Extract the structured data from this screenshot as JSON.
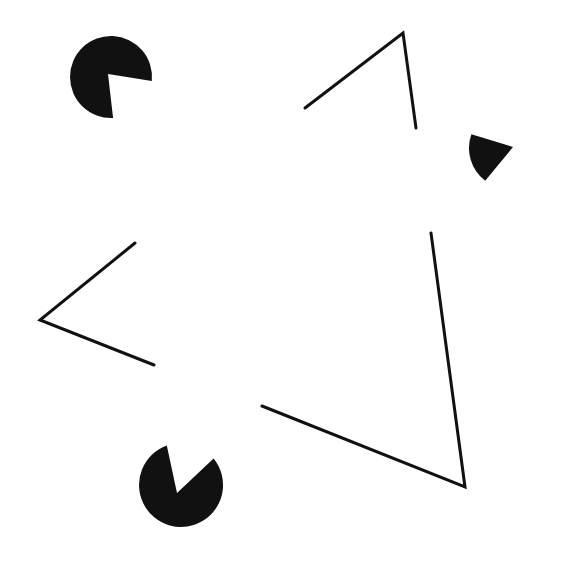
{
  "figure": {
    "width": 584,
    "height": 565,
    "background": "#ffffff",
    "ink_color": "#111111",
    "line_width": 3
  },
  "inducers": [
    {
      "name": "top-left",
      "cx": 111,
      "cy": 77,
      "r": 41,
      "mouth": [
        [
          151,
          81
        ],
        [
          108,
          74
        ],
        [
          113,
          116
        ]
      ]
    },
    {
      "name": "right",
      "cx": 510,
      "cy": 148,
      "r": 41,
      "mouth": [
        [
          468,
          133
        ],
        [
          513,
          147
        ],
        [
          485,
          181
        ]
      ]
    },
    {
      "name": "bottom",
      "cx": 181,
      "cy": 485,
      "r": 42,
      "mouth": [
        [
          167,
          446
        ],
        [
          177,
          493
        ],
        [
          213,
          459
        ]
      ]
    }
  ],
  "outline_corners": [
    {
      "name": "top",
      "points": [
        [
          305,
          108
        ],
        [
          403,
          33
        ],
        [
          416,
          128
        ]
      ]
    },
    {
      "name": "left",
      "points": [
        [
          135,
          243
        ],
        [
          40,
          320
        ],
        [
          154,
          365
        ]
      ]
    },
    {
      "name": "bottom-right",
      "points": [
        [
          431,
          233
        ],
        [
          465,
          487
        ],
        [
          262,
          406
        ]
      ]
    }
  ]
}
